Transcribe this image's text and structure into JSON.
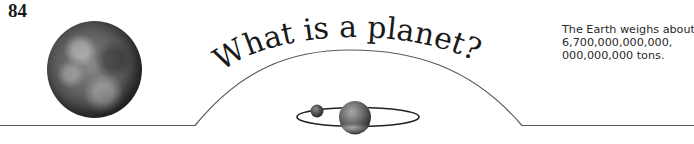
{
  "page": {
    "number": "84",
    "title": "What is a planet?"
  },
  "fact_box": {
    "lines": [
      "The Earth weighs about",
      "6,700,000,000,000,",
      "000,000,000 tons."
    ]
  },
  "illustrations": {
    "earth": "earth-globe-photo",
    "orbit": "planet-with-orbiting-moon"
  },
  "colors": {
    "text": "#1a1a1a",
    "rule": "#555555",
    "background": "#ffffff"
  }
}
